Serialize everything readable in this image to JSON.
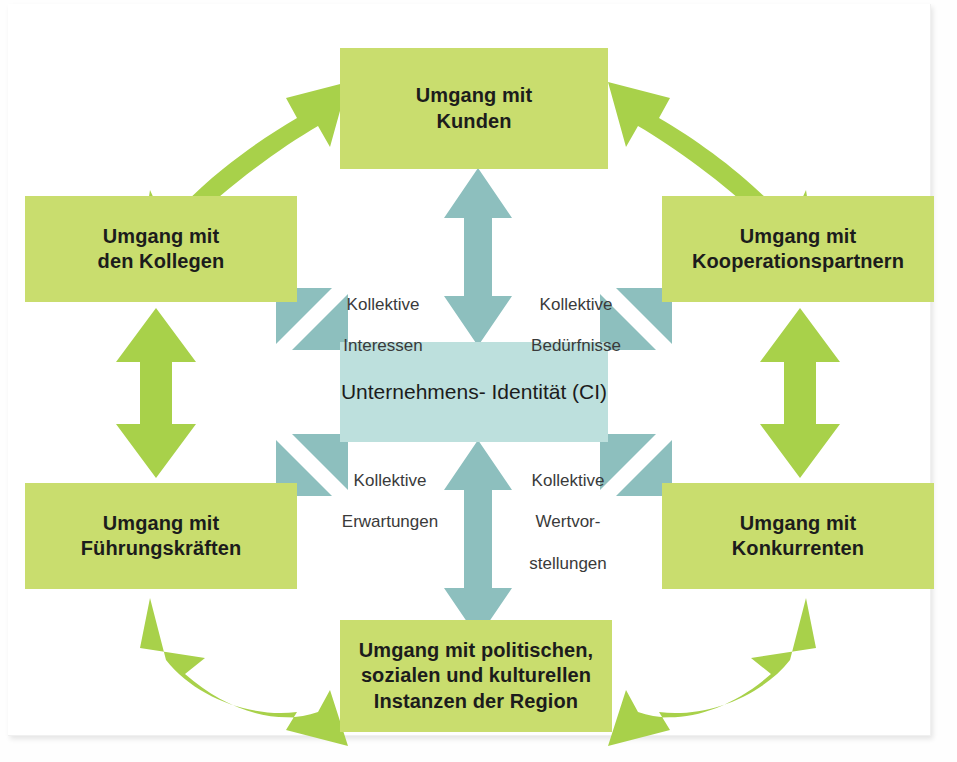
{
  "diagram": {
    "type": "hub-and-spoke relationship diagram",
    "center": {
      "label_line1": "Unternehmens-",
      "label_line2": "Identität (CI)",
      "color": "#bde0dd"
    },
    "boxes": [
      {
        "id": "kunden",
        "position": "top",
        "line1": "Umgang mit",
        "line2": "Kunden",
        "line3": "",
        "color": "#c9dd6e"
      },
      {
        "id": "kollegen",
        "position": "top-left",
        "line1": "Umgang mit",
        "line2": "den Kollegen",
        "line3": "",
        "color": "#c9dd6e"
      },
      {
        "id": "koop",
        "position": "top-right",
        "line1": "Umgang mit",
        "line2": "Kooperationspartnern",
        "line3": "",
        "color": "#c9dd6e"
      },
      {
        "id": "fuehrung",
        "position": "bottom-left",
        "line1": "Umgang mit",
        "line2": "Führungskräften",
        "line3": "",
        "color": "#c9dd6e"
      },
      {
        "id": "konkurrenten",
        "position": "bottom-right",
        "line1": "Umgang mit",
        "line2": "Konkurrenten",
        "line3": "",
        "color": "#c9dd6e"
      },
      {
        "id": "region",
        "position": "bottom",
        "line1": "Umgang mit politischen,",
        "line2": "sozialen und kulturellen",
        "line3": "Instanzen der Region",
        "color": "#c9dd6e"
      }
    ],
    "connector_labels": [
      {
        "id": "interessen",
        "line1": "Kollektive",
        "line2": "Interessen",
        "line3": "",
        "quadrant": "upper-left"
      },
      {
        "id": "beduerfnisse",
        "line1": "Kollektive",
        "line2": "Bedürfnisse",
        "line3": "",
        "quadrant": "upper-right"
      },
      {
        "id": "erwartungen",
        "line1": "Kollektive",
        "line2": "Erwartungen",
        "line3": "",
        "quadrant": "lower-left"
      },
      {
        "id": "wertvor",
        "line1": "Kollektive",
        "line2": "Wertvor-",
        "line3": "stellungen",
        "quadrant": "lower-right"
      }
    ],
    "arrows": {
      "blue_color": "#8dbfbe",
      "green_color": "#a8d14a",
      "vertical_double_top": "center ↔ Kunden",
      "vertical_double_bottom": "center ↔ Instanzen der Region",
      "diagonal_double_upper_left": "center ↔ den Kollegen",
      "diagonal_double_upper_right": "center ↔ Kooperationspartnern",
      "diagonal_double_lower_left": "center ↔ Führungskräften",
      "diagonal_double_lower_right": "center ↔ Konkurrenten",
      "green_vertical_left": "den Kollegen ↔ Führungskräften",
      "green_vertical_right": "Kooperationspartnern ↔ Konkurrenten",
      "green_curved_top_left": "den Kollegen ↔ Kunden",
      "green_curved_top_right": "Kunden ↔ Kooperationspartnern",
      "green_curved_bottom_left": "Führungskräften ↔ Instanzen der Region",
      "green_curved_bottom_right": "Instanzen der Region ↔ Konkurrenten"
    }
  }
}
